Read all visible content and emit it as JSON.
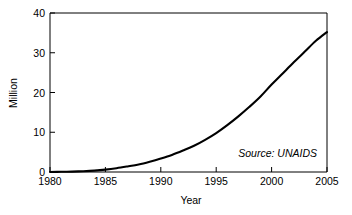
{
  "chart_data": {
    "type": "line",
    "title": "",
    "subtitle": "",
    "xlabel": "Year",
    "ylabel": "Million",
    "xlim": [
      1980,
      2005
    ],
    "ylim": [
      0,
      40
    ],
    "grid": false,
    "legend": false,
    "legend_position": "none",
    "annotations": [
      {
        "name": "source-note",
        "text": "Source: UNAIDS",
        "x": 2000.0,
        "y": 5.0,
        "style": "italic"
      }
    ],
    "x_ticks": [
      1980,
      1985,
      1990,
      1995,
      2000,
      2005
    ],
    "x_tick_labels": [
      "1980",
      "1985",
      "1990",
      "1995",
      "2000",
      "2005"
    ],
    "y_ticks": [
      0,
      10,
      20,
      30,
      40
    ],
    "y_tick_labels": [
      "0",
      "10",
      "20",
      "30",
      "40"
    ],
    "series": [
      {
        "name": "People living with HIV/AIDS",
        "color": "#000000",
        "x": [
          1980,
          1981,
          1982,
          1983,
          1984,
          1985,
          1986,
          1987,
          1988,
          1989,
          1990,
          1991,
          1992,
          1993,
          1994,
          1995,
          1996,
          1997,
          1998,
          1999,
          2000,
          2001,
          2002,
          2003,
          2004,
          2005
        ],
        "values": [
          0.0,
          0.05,
          0.1,
          0.2,
          0.35,
          0.6,
          0.95,
          1.4,
          1.9,
          2.6,
          3.4,
          4.3,
          5.4,
          6.6,
          8.1,
          9.8,
          11.8,
          14.0,
          16.4,
          19.0,
          22.0,
          24.8,
          27.6,
          30.3,
          33.0,
          35.2
        ]
      }
    ]
  },
  "axes": {
    "x_title": "Year",
    "y_title": "Million"
  },
  "source": {
    "label": "Source: UNAIDS"
  },
  "colors": {
    "curve": "#000000",
    "axis": "#000000",
    "background": "#ffffff"
  }
}
